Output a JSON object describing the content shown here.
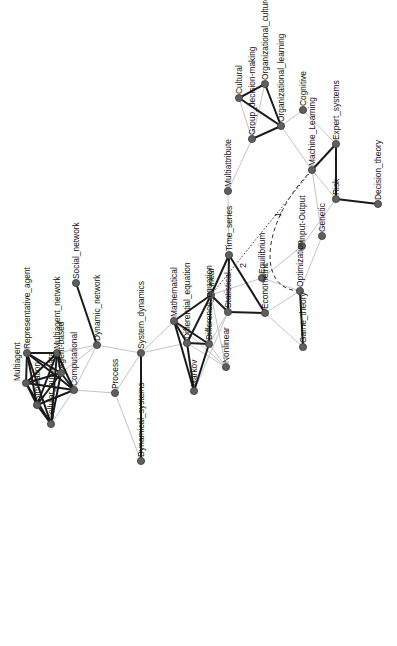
{
  "diagram": {
    "type": "network",
    "orientation": "rotated -90deg (labels read bottom-to-top)",
    "colors": {
      "node_fill": "#5f5f5f",
      "strong_edge": "#1a1a1a",
      "weak_edge": "#c4c4c4",
      "background": "#ffffff"
    },
    "nodes": [
      {
        "id": "Representative_agent",
        "label": "Representative_agent",
        "x": 27,
        "y": 353
      },
      {
        "id": "Multiagent_network",
        "label": "Multiagent_network",
        "x": 57,
        "y": 353
      },
      {
        "id": "Agent-based",
        "label": "Agent-based",
        "x": 61,
        "y": 373
      },
      {
        "id": "Multiagent",
        "label": "Multiagent",
        "x": 26,
        "y": 383,
        "label_side": "left"
      },
      {
        "id": "Computational",
        "label": "Computational",
        "x": 74,
        "y": 390
      },
      {
        "id": "Simulation",
        "label": "Simulation",
        "x": 37,
        "y": 405
      },
      {
        "id": "Cellular_automata",
        "label": "Cellular_automata",
        "x": 51,
        "y": 424
      },
      {
        "id": "Social_network",
        "label": "Social_network",
        "x": 76,
        "y": 283
      },
      {
        "id": "Dynamic_network",
        "label": "Dynamic_network",
        "x": 97,
        "y": 345
      },
      {
        "id": "Process",
        "label": "Process",
        "x": 115,
        "y": 393
      },
      {
        "id": "System_dynamics",
        "label": "System_dynamics",
        "x": 141,
        "y": 353
      },
      {
        "id": "Dynamical_systems",
        "label": "Dynamical_systems",
        "x": 141,
        "y": 461
      },
      {
        "id": "Mathematical",
        "label": "Mathematical",
        "x": 174,
        "y": 321
      },
      {
        "id": "Differential_equation",
        "label": "Differential_equation",
        "x": 187,
        "y": 343
      },
      {
        "id": "Difference_equation",
        "label": "Difference_equation",
        "x": 209,
        "y": 344
      },
      {
        "id": "Linear",
        "label": "Linear",
        "x": 211,
        "y": 295
      },
      {
        "id": "Statistical",
        "label": "Statistical",
        "x": 228,
        "y": 312
      },
      {
        "id": "Markov",
        "label": "Markov",
        "x": 194,
        "y": 391
      },
      {
        "id": "Nonlinear",
        "label": "Nonlinear",
        "x": 226,
        "y": 367
      },
      {
        "id": "Time_series",
        "label": "Time_series",
        "x": 229,
        "y": 255
      },
      {
        "id": "Multiattribute",
        "label": "Multiattribute",
        "x": 228,
        "y": 191
      },
      {
        "id": "Econometric",
        "label": "Econometric",
        "x": 265,
        "y": 313
      },
      {
        "id": "Equilibrium",
        "label": "Equilibrium",
        "x": 262,
        "y": 278
      },
      {
        "id": "Optimization",
        "label": "Optimization",
        "x": 300,
        "y": 291
      },
      {
        "id": "Game_theory",
        "label": "Game_theory",
        "x": 303,
        "y": 347
      },
      {
        "id": "Input-Output",
        "label": "Input-Output",
        "x": 302,
        "y": 246
      },
      {
        "id": "Genetic",
        "label": "Genetic",
        "x": 322,
        "y": 236
      },
      {
        "id": "Group_decision-making",
        "label": "Group_decision-making",
        "x": 252,
        "y": 139
      },
      {
        "id": "Cultural",
        "label": "Cultural",
        "x": 239,
        "y": 98
      },
      {
        "id": "Organizational_culture",
        "label": "Organizational_culture",
        "x": 265,
        "y": 84
      },
      {
        "id": "Organizational_learning",
        "label": "Organizational_learning",
        "x": 281,
        "y": 126
      },
      {
        "id": "Cognitive",
        "label": "Cognitive",
        "x": 303,
        "y": 110
      },
      {
        "id": "Machine_Learning",
        "label": "Machine_Learning",
        "x": 312,
        "y": 170
      },
      {
        "id": "Expert_systems",
        "label": "Expert_systems",
        "x": 336,
        "y": 144
      },
      {
        "id": "Risk",
        "label": "Risk",
        "x": 336,
        "y": 199
      },
      {
        "id": "Decision_theory",
        "label": "Decision_theory",
        "x": 378,
        "y": 204
      }
    ],
    "edges": [
      {
        "source": "Representative_agent",
        "target": "Multiagent_network",
        "style": "strong"
      },
      {
        "source": "Representative_agent",
        "target": "Multiagent",
        "style": "strong"
      },
      {
        "source": "Representative_agent",
        "target": "Simulation",
        "style": "strong"
      },
      {
        "source": "Representative_agent",
        "target": "Agent-based",
        "style": "strong"
      },
      {
        "source": "Representative_agent",
        "target": "Computational",
        "style": "strong"
      },
      {
        "source": "Representative_agent",
        "target": "Cellular_automata",
        "style": "strong"
      },
      {
        "source": "Multiagent_network",
        "target": "Agent-based",
        "style": "strong"
      },
      {
        "source": "Multiagent_network",
        "target": "Multiagent",
        "style": "strong"
      },
      {
        "source": "Multiagent_network",
        "target": "Simulation",
        "style": "strong"
      },
      {
        "source": "Multiagent_network",
        "target": "Computational",
        "style": "strong"
      },
      {
        "source": "Multiagent_network",
        "target": "Cellular_automata",
        "style": "strong"
      },
      {
        "source": "Agent-based",
        "target": "Multiagent",
        "style": "strong"
      },
      {
        "source": "Agent-based",
        "target": "Simulation",
        "style": "strong"
      },
      {
        "source": "Agent-based",
        "target": "Computational",
        "style": "strong"
      },
      {
        "source": "Agent-based",
        "target": "Cellular_automata",
        "style": "strong"
      },
      {
        "source": "Multiagent",
        "target": "Simulation",
        "style": "strong"
      },
      {
        "source": "Multiagent",
        "target": "Computational",
        "style": "strong"
      },
      {
        "source": "Multiagent",
        "target": "Cellular_automata",
        "style": "strong"
      },
      {
        "source": "Simulation",
        "target": "Computational",
        "style": "strong"
      },
      {
        "source": "Simulation",
        "target": "Cellular_automata",
        "style": "strong"
      },
      {
        "source": "Computational",
        "target": "Cellular_automata",
        "style": "weak"
      },
      {
        "source": "Multiagent_network",
        "target": "Dynamic_network",
        "style": "weak"
      },
      {
        "source": "Agent-based",
        "target": "Dynamic_network",
        "style": "weak"
      },
      {
        "source": "Computational",
        "target": "Dynamic_network",
        "style": "weak"
      },
      {
        "source": "Computational",
        "target": "Process",
        "style": "weak"
      },
      {
        "source": "Social_network",
        "target": "Dynamic_network",
        "style": "strong"
      },
      {
        "source": "Dynamic_network",
        "target": "System_dynamics",
        "style": "weak"
      },
      {
        "source": "Process",
        "target": "System_dynamics",
        "style": "weak"
      },
      {
        "source": "Process",
        "target": "Dynamical_systems",
        "style": "weak"
      },
      {
        "source": "System_dynamics",
        "target": "Dynamical_systems",
        "style": "strong"
      },
      {
        "source": "System_dynamics",
        "target": "Mathematical",
        "style": "weak"
      },
      {
        "source": "System_dynamics",
        "target": "Differential_equation",
        "style": "weak"
      },
      {
        "source": "Mathematical",
        "target": "Differential_equation",
        "style": "strong"
      },
      {
        "source": "Mathematical",
        "target": "Difference_equation",
        "style": "strong"
      },
      {
        "source": "Mathematical",
        "target": "Markov",
        "style": "strong"
      },
      {
        "source": "Mathematical",
        "target": "Nonlinear",
        "style": "weak"
      },
      {
        "source": "Mathematical",
        "target": "Linear",
        "style": "strong"
      },
      {
        "source": "Differential_equation",
        "target": "Difference_equation",
        "style": "strong"
      },
      {
        "source": "Differential_equation",
        "target": "Markov",
        "style": "strong"
      },
      {
        "source": "Differential_equation",
        "target": "Linear",
        "style": "strong"
      },
      {
        "source": "Differential_equation",
        "target": "Nonlinear",
        "style": "weak"
      },
      {
        "source": "Difference_equation",
        "target": "Markov",
        "style": "strong"
      },
      {
        "source": "Difference_equation",
        "target": "Linear",
        "style": "strong"
      },
      {
        "source": "Difference_equation",
        "target": "Nonlinear",
        "style": "weak"
      },
      {
        "source": "Difference_equation",
        "target": "Statistical",
        "style": "weak"
      },
      {
        "source": "Linear",
        "target": "Statistical",
        "style": "strong"
      },
      {
        "source": "Linear",
        "target": "Nonlinear",
        "style": "weak"
      },
      {
        "source": "Linear",
        "target": "Equilibrium",
        "style": "weak"
      },
      {
        "source": "Linear",
        "target": "Time_series",
        "style": "strong"
      },
      {
        "source": "Statistical",
        "target": "Time_series",
        "style": "strong"
      },
      {
        "source": "Statistical",
        "target": "Econometric",
        "style": "strong"
      },
      {
        "source": "Statistical",
        "target": "Markov",
        "style": "weak"
      },
      {
        "source": "Time_series",
        "target": "Econometric",
        "style": "strong"
      },
      {
        "source": "Time_series",
        "target": "Multiattribute",
        "style": "weak"
      },
      {
        "source": "Multiattribute",
        "target": "Group_decision-making",
        "style": "weak"
      },
      {
        "source": "Econometric",
        "target": "Equilibrium",
        "style": "weak"
      },
      {
        "source": "Econometric",
        "target": "Optimization",
        "style": "weak"
      },
      {
        "source": "Econometric",
        "target": "Game_theory",
        "style": "weak"
      },
      {
        "source": "Equilibrium",
        "target": "Optimization",
        "style": "weak"
      },
      {
        "source": "Equilibrium",
        "target": "Input-Output",
        "style": "weak"
      },
      {
        "source": "Optimization",
        "target": "Game_theory",
        "style": "strong"
      },
      {
        "source": "Optimization",
        "target": "Genetic",
        "style": "weak"
      },
      {
        "source": "Input-Output",
        "target": "Risk",
        "style": "weak"
      },
      {
        "source": "Genetic",
        "target": "Machine_Learning",
        "style": "weak"
      },
      {
        "source": "Group_decision-making",
        "target": "Cultural",
        "style": "weak"
      },
      {
        "source": "Group_decision-making",
        "target": "Organizational_culture",
        "style": "weak"
      },
      {
        "source": "Group_decision-making",
        "target": "Organizational_learning",
        "style": "strong"
      },
      {
        "source": "Cultural",
        "target": "Organizational_culture",
        "style": "strong"
      },
      {
        "source": "Cultural",
        "target": "Organizational_learning",
        "style": "strong"
      },
      {
        "source": "Organizational_culture",
        "target": "Organizational_learning",
        "style": "strong"
      },
      {
        "source": "Organizational_learning",
        "target": "Cognitive",
        "style": "weak"
      },
      {
        "source": "Organizational_learning",
        "target": "Machine_Learning",
        "style": "weak"
      },
      {
        "source": "Cognitive",
        "target": "Expert_systems",
        "style": "weak"
      },
      {
        "source": "Machine_Learning",
        "target": "Expert_systems",
        "style": "strong"
      },
      {
        "source": "Machine_Learning",
        "target": "Risk",
        "style": "weak"
      },
      {
        "source": "Expert_systems",
        "target": "Risk",
        "style": "strong"
      },
      {
        "source": "Risk",
        "target": "Decision_theory",
        "style": "strong"
      }
    ],
    "special_edges": [
      {
        "source": "Linear",
        "target": "Machine_Learning",
        "style": "dotted",
        "label": "2",
        "label_x": 246,
        "label_y": 268
      },
      {
        "source": "Optimization",
        "target": "Machine_Learning",
        "style": "dashed",
        "curved": true,
        "label": "1",
        "label_x": 281,
        "label_y": 217
      }
    ]
  }
}
